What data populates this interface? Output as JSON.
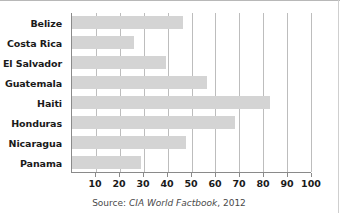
{
  "chart_data": {
    "type": "bar",
    "orientation": "horizontal",
    "title": "",
    "xlabel": "",
    "ylabel": "",
    "categories": [
      "Belize",
      "Costa Rica",
      "El Salvador",
      "Guatemala",
      "Haiti",
      "Honduras",
      "Nicaragua",
      "Panama"
    ],
    "values": [
      46.5,
      26,
      39.5,
      56.5,
      83,
      68,
      47.5,
      29
    ],
    "xlim": [
      0,
      100
    ],
    "xticks": [
      10,
      20,
      30,
      40,
      50,
      60,
      70,
      80,
      90,
      100
    ],
    "xtick_labels": [
      "10",
      "20",
      "30",
      "40",
      "50",
      "60",
      "70",
      "80",
      "90",
      "100"
    ],
    "grid": "vertical",
    "legend": "none",
    "bar_color": "#d4d4d4",
    "axis_color": "#8a8a8a",
    "gridline_color": "#bdbdbd"
  },
  "source": {
    "prefix": "Source: ",
    "title": "CIA World Factbook",
    "suffix": ", 2012"
  }
}
